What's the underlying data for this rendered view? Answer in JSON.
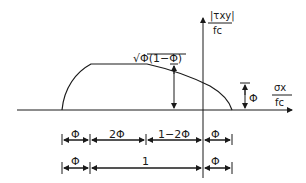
{
  "diagram": {
    "type": "yield-surface-sketch",
    "axes": {
      "y_label_num": "|τxy|",
      "y_label_den": "fc",
      "x_label_num": "σx",
      "x_label_den": "fc"
    },
    "annotations": {
      "peak": "√Φ(1−Φ)",
      "right_height": "Φ"
    },
    "dimension_row_1": [
      "Φ",
      "2Φ",
      "1−2Φ",
      "Φ"
    ],
    "dimension_row_2": [
      "Φ",
      "1",
      "Φ"
    ]
  }
}
